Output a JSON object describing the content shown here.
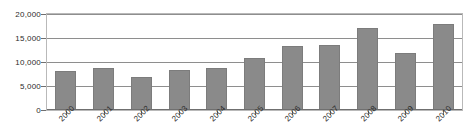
{
  "chart_data": {
    "type": "bar",
    "title": "",
    "subtitle": "",
    "xlabel": "",
    "ylabel": "",
    "categories": [
      "2000",
      "2001",
      "2002",
      "2003",
      "2004",
      "2005",
      "2006",
      "2007",
      "2008",
      "2009",
      "2010"
    ],
    "values": [
      8100,
      8800,
      6800,
      8300,
      8800,
      10800,
      13400,
      13500,
      17000,
      11800,
      17900
    ],
    "ylim": [
      0,
      20000
    ],
    "ytick_labels": [
      "20,000",
      "15,000",
      "10,000",
      "5,000",
      "0"
    ],
    "ytick_values": [
      20000,
      15000,
      10000,
      5000,
      0
    ],
    "grid": true,
    "legend": false,
    "legend_position": "none",
    "series": [
      {
        "name": "",
        "values": [
          8100,
          8800,
          6800,
          8300,
          8800,
          10800,
          13400,
          13500,
          17000,
          11800,
          17900
        ]
      }
    ],
    "bar_color": "#8a8a8a",
    "gridline_color": "#8e8e8e",
    "frame_color": "#b9b9b9",
    "text_color": "#2b2b2b",
    "background_color": "#ffffff"
  }
}
